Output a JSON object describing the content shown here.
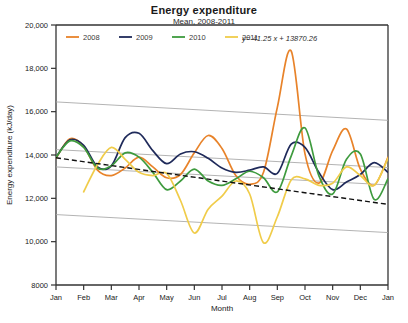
{
  "chart_data": {
    "type": "line",
    "title": "Energy expenditure",
    "subtitle": "Mean, 2008-2011",
    "xlabel": "Month",
    "ylabel": "Energy expenditure (kJ/day)",
    "xlim": [
      0,
      12
    ],
    "ylim": [
      8000,
      20000
    ],
    "yticks": [
      8000,
      10000,
      12000,
      14000,
      16000,
      18000,
      20000
    ],
    "ytick_labels": [
      "8000",
      "10,000",
      "12,000",
      "14,000",
      "16,000",
      "18,000",
      "20,000"
    ],
    "categories": [
      "Jan",
      "Feb",
      "Mar",
      "Apr",
      "May",
      "Jun",
      "Jul",
      "Aug",
      "Sep",
      "Oct",
      "Nov",
      "Dec",
      "Jan"
    ],
    "grid": false,
    "legend_position": "top-left-inside",
    "annotation": "y=-41.25 x + 13870.26",
    "trend_line": {
      "name": "trend",
      "slope": -41.25,
      "intercept": 13870.26,
      "style": "dashed",
      "color": "#111111"
    },
    "interval_lines": [
      {
        "name": "upper-outer",
        "color": "#aaaaaa",
        "y_start": 16450,
        "y_end": 15600
      },
      {
        "name": "upper-inner",
        "color": "#aaaaaa",
        "y_start": 14250,
        "y_end": 13420
      },
      {
        "name": "lower-inner",
        "color": "#aaaaaa",
        "y_start": 13450,
        "y_end": 12620
      },
      {
        "name": "lower-outer",
        "color": "#aaaaaa",
        "y_start": 11250,
        "y_end": 10420
      }
    ],
    "series": [
      {
        "name": "2008",
        "color": "#E8832A",
        "x": [
          0,
          0.5,
          1,
          1.5,
          2,
          2.5,
          3,
          3.5,
          4,
          4.5,
          5,
          5.5,
          6,
          6.5,
          7,
          7.5,
          8,
          8.5,
          9,
          9.5,
          10,
          10.5,
          11,
          11.5,
          12
        ],
        "values": [
          13850,
          14750,
          14400,
          13300,
          13050,
          13400,
          13900,
          13450,
          12950,
          13100,
          14100,
          14900,
          14300,
          13050,
          12650,
          13200,
          16200,
          18800,
          14050,
          12700,
          14200,
          15200,
          13350,
          12600,
          13900
        ]
      },
      {
        "name": "2009",
        "color": "#1F2A5A",
        "x": [
          0,
          0.5,
          1,
          1.5,
          2,
          2.5,
          3,
          3.5,
          4,
          4.5,
          5,
          5.5,
          6,
          6.5,
          7,
          7.5,
          8,
          8.5,
          9,
          9.5,
          10,
          10.5,
          11,
          11.5,
          12
        ],
        "values": [
          13900,
          14700,
          14450,
          13450,
          13500,
          14800,
          15000,
          14200,
          13600,
          14050,
          14150,
          13850,
          13400,
          13200,
          13300,
          13450,
          13150,
          14500,
          14350,
          13200,
          12400,
          12750,
          13100,
          13650,
          13200
        ]
      },
      {
        "name": "2010",
        "color": "#3E9B3E",
        "x": [
          0,
          0.5,
          1,
          1.5,
          2,
          2.5,
          3,
          3.5,
          4,
          4.5,
          5,
          5.5,
          6,
          6.5,
          7,
          7.5,
          8,
          8.5,
          9,
          9.5,
          10,
          10.5,
          11,
          11.5,
          12
        ],
        "values": [
          13900,
          14650,
          14350,
          13400,
          13500,
          14100,
          13900,
          13200,
          12400,
          12800,
          13350,
          12800,
          12600,
          12900,
          13250,
          12950,
          12300,
          13950,
          15250,
          13050,
          12200,
          13800,
          14050,
          11950,
          12900
        ]
      },
      {
        "name": "2011",
        "color": "#F0CC4A",
        "x": [
          1,
          1.5,
          2,
          2.5,
          3,
          3.5,
          4,
          4.5,
          5,
          5.5,
          6,
          6.5,
          7,
          7.5,
          8,
          8.5,
          9,
          9.5,
          10,
          10.5,
          11,
          11.5,
          12
        ],
        "values": [
          12300,
          13550,
          14350,
          13800,
          13200,
          13050,
          13150,
          11900,
          10400,
          11500,
          12100,
          12800,
          12200,
          9950,
          11150,
          12850,
          12900,
          12600,
          12700,
          13450,
          13050,
          12600,
          13850
        ]
      }
    ]
  },
  "legend": {
    "items": [
      {
        "label": "2008",
        "color": "#E8832A"
      },
      {
        "label": "2009",
        "color": "#1F2A5A"
      },
      {
        "label": "2010",
        "color": "#3E9B3E"
      },
      {
        "label": "2011",
        "color": "#F0CC4A"
      }
    ]
  }
}
